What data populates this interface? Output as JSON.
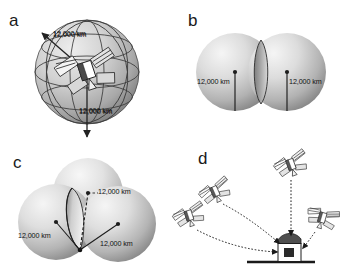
{
  "figure": {
    "background_color": "#ffffff",
    "line_color": "#1a1a1a",
    "sphere_light": "#f2f2f2",
    "sphere_mid": "#c9c9c9",
    "sphere_dark": "#8e8e8e"
  },
  "panels": [
    {
      "id": "a",
      "letter": "a",
      "caption_omitted": true,
      "description": "single sphere of possible positions around one satellite",
      "labels": [
        {
          "text": "12,000 km"
        },
        {
          "text": "12,000 km"
        }
      ],
      "satellite_count": 1,
      "sphere_count": 1
    },
    {
      "id": "b",
      "letter": "b",
      "description": "two intersecting spheres producing a circle of intersection",
      "labels": [
        {
          "text": "12,000 km"
        },
        {
          "text": "12,000 km"
        }
      ],
      "satellite_count": 0,
      "sphere_count": 2
    },
    {
      "id": "c",
      "letter": "c",
      "description": "three intersecting spheres narrowing position to two points",
      "labels": [
        {
          "text": "12,000 km"
        },
        {
          "text": "12,000 km"
        },
        {
          "text": "12,000 km"
        }
      ],
      "satellite_count": 0,
      "sphere_count": 3
    },
    {
      "id": "d",
      "letter": "d",
      "description": "four satellites transmitting signals to a ground receiver",
      "labels": [],
      "satellite_count": 4,
      "sphere_count": 0,
      "receiver": "ground-station-building"
    }
  ],
  "icons": {
    "satellite": "satellite-icon",
    "receiver": "ground-receiver-icon",
    "arrow": "arrow-icon",
    "sphere": "sphere-icon"
  }
}
